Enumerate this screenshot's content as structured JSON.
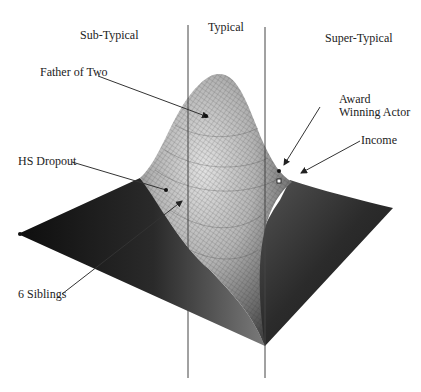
{
  "diagram": {
    "type": "3d-surface-bell-curve",
    "regions": [
      {
        "label": "Sub-Typical"
      },
      {
        "label": "Typical"
      },
      {
        "label": "Super-Typical"
      }
    ],
    "annotations": [
      {
        "label": "Father of Two"
      },
      {
        "label": "Award\nWinning Actor",
        "line1": "Award",
        "line2": "Winning Actor"
      },
      {
        "label": "Income"
      },
      {
        "label": "HS Dropout"
      },
      {
        "label": "6 Siblings"
      }
    ],
    "colors": {
      "surface_dark": "#1e1e1e",
      "surface_mid": "#6a6a6a",
      "surface_light": "#d8d8d8",
      "mesh": "#333333",
      "divider": "#444444",
      "arrow": "#333333"
    }
  }
}
